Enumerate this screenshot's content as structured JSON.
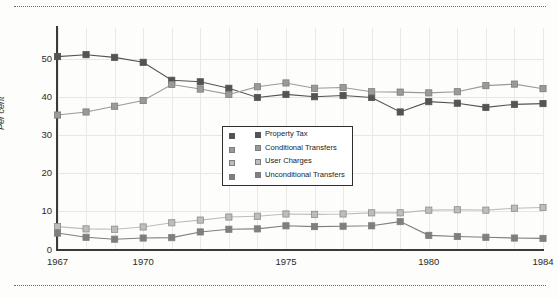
{
  "chart_data": {
    "type": "line",
    "title": "",
    "xlabel": "",
    "ylabel": "Per cent",
    "ylim": [
      0,
      55
    ],
    "xlim": [
      1967,
      1984
    ],
    "grid": true,
    "legend_position": "inside-center",
    "y_ticks": [
      0,
      10,
      20,
      30,
      40,
      50
    ],
    "x_ticks": [
      1967,
      1970,
      1975,
      1980,
      1984
    ],
    "x": [
      1967,
      1968,
      1969,
      1970,
      1971,
      1972,
      1973,
      1974,
      1975,
      1976,
      1977,
      1978,
      1979,
      1980,
      1981,
      1982,
      1983,
      1984
    ],
    "series": [
      {
        "name": "Property Tax",
        "color": "#545454",
        "values": [
          50.5,
          51.0,
          50.3,
          49.0,
          44.3,
          43.9,
          42.2,
          39.8,
          40.6,
          40.0,
          40.3,
          39.8,
          36.0,
          38.7,
          38.3,
          37.2,
          38.0,
          38.2
        ]
      },
      {
        "name": "Conditional Transfers",
        "color": "#9a9a9a",
        "values": [
          35.2,
          36.0,
          37.5,
          39.0,
          43.2,
          42.0,
          40.6,
          42.6,
          43.6,
          42.2,
          42.4,
          41.3,
          41.2,
          41.0,
          41.3,
          42.9,
          43.3,
          42.1
        ]
      },
      {
        "name": "User Charges",
        "color": "#bdbdbd",
        "values": [
          6.0,
          5.4,
          5.3,
          5.9,
          7.0,
          7.7,
          8.5,
          8.7,
          9.3,
          9.2,
          9.3,
          9.6,
          9.6,
          10.3,
          10.4,
          10.3,
          10.8,
          11.0
        ]
      },
      {
        "name": "Unconditional Transfers",
        "color": "#7f7f7f",
        "values": [
          4.3,
          3.2,
          2.7,
          3.0,
          3.1,
          4.6,
          5.3,
          5.4,
          6.2,
          6.0,
          6.1,
          6.2,
          7.3,
          3.7,
          3.4,
          3.2,
          3.0,
          2.9
        ]
      }
    ]
  },
  "legend": {
    "items": [
      {
        "label": "Property Tax"
      },
      {
        "label": "Conditional Transfers"
      },
      {
        "label": "User Charges"
      },
      {
        "label": "Unconditional Transfers"
      }
    ]
  }
}
